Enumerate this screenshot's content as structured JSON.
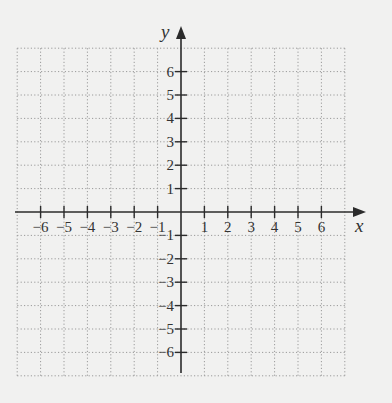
{
  "chart_data": {
    "type": "coordinate-grid",
    "title": "",
    "xlabel": "x",
    "ylabel": "y",
    "xlim": [
      -7,
      7
    ],
    "ylim": [
      -7,
      7
    ],
    "grid": true,
    "grid_style": "dotted",
    "x_ticks": [
      -6,
      -5,
      -4,
      -3,
      -2,
      -1,
      1,
      2,
      3,
      4,
      5,
      6
    ],
    "y_ticks": [
      -6,
      -5,
      -4,
      -3,
      -2,
      -1,
      1,
      2,
      3,
      4,
      5,
      6
    ],
    "x_tick_labels": [
      "−6",
      "−5",
      "−4",
      "−3",
      "−2",
      "−1",
      "1",
      "2",
      "3",
      "4",
      "5",
      "6"
    ],
    "y_tick_labels": [
      "−6",
      "−5",
      "−4",
      "−3",
      "−2",
      "−1",
      "1",
      "2",
      "3",
      "4",
      "5",
      "6"
    ],
    "points": [],
    "series": []
  },
  "colors": {
    "background": "#f1f1f0",
    "axis": "#2b2b2b",
    "grid": "#9a9a9a",
    "text": "#333333"
  }
}
